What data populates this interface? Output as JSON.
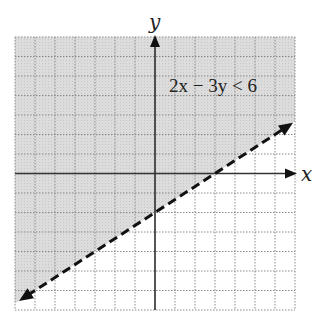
{
  "chart_data": {
    "type": "inequality-graph",
    "title": "",
    "inequality": "2x − 3y < 6",
    "boundary_line": {
      "equation": "2x - 3y = 6",
      "slope": 0.6667,
      "y_intercept": -2,
      "x_intercept": 3,
      "style": "dashed",
      "arrows": "both"
    },
    "shaded_region": "above boundary line (y > (2/3)x − 2)",
    "xlabel": "x",
    "ylabel": "y",
    "xlim": [
      -7,
      7
    ],
    "ylim": [
      -7,
      7
    ],
    "grid": true,
    "grid_step": 1,
    "colors": {
      "shade": "#d9d9d9",
      "grid": "#8a8a8a",
      "axis": "#333333",
      "line": "#111111"
    }
  },
  "labels": {
    "x_axis": "x",
    "y_axis": "y",
    "inequality": "2x − 3y < 6"
  }
}
